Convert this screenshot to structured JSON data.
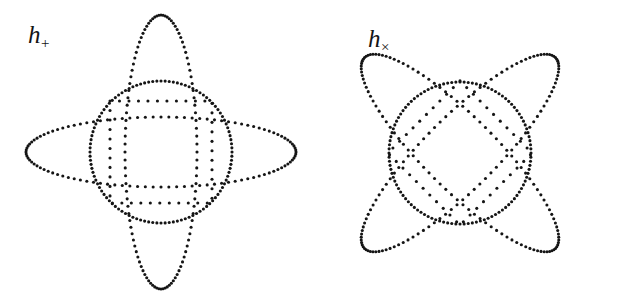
{
  "figure": {
    "domain": "diagram",
    "caption_absent": true,
    "background_color": "#ffffff",
    "ink_color": "#151515",
    "width": 621,
    "height": 298,
    "style": {
      "stroke_rendering": "dotted",
      "dot_radius_px": 1.55,
      "dot_spacing_mode": "uniform-parameter-angle",
      "dots_per_curve": 108
    },
    "panels": [
      {
        "id": "h-plus",
        "name": "plus-polarization",
        "label_text": "h",
        "label_subscript": "+",
        "label_x": 28,
        "label_y": 22,
        "center_x": 161,
        "center_y": 152,
        "shapes": [
          {
            "name": "reference-circle",
            "type": "ellipse",
            "rx": 71,
            "ry": 71,
            "rotation_deg": 0
          },
          {
            "name": "vertical-ellipse",
            "type": "ellipse",
            "rx": 36,
            "ry": 137,
            "rotation_deg": 0
          },
          {
            "name": "horizontal-ellipse",
            "type": "ellipse",
            "rx": 135,
            "ry": 35,
            "rotation_deg": 0
          },
          {
            "name": "inscribed-square",
            "type": "square",
            "half_size": 51,
            "rotation_deg": 0
          }
        ]
      },
      {
        "id": "h-cross",
        "name": "cross-polarization",
        "label_text": "h",
        "label_subscript": "×",
        "label_x": 368,
        "label_y": 26,
        "center_x": 460,
        "center_y": 153,
        "shapes": [
          {
            "name": "reference-circle",
            "type": "ellipse",
            "rx": 71,
            "ry": 71,
            "rotation_deg": 0
          },
          {
            "name": "diagonal-ellipse-up",
            "type": "ellipse",
            "rx": 36,
            "ry": 135,
            "rotation_deg": 45
          },
          {
            "name": "diagonal-ellipse-down",
            "type": "ellipse",
            "rx": 135,
            "ry": 36,
            "rotation_deg": 45
          },
          {
            "name": "inscribed-diamond",
            "type": "square",
            "half_size": 51,
            "rotation_deg": 45
          }
        ]
      }
    ]
  }
}
